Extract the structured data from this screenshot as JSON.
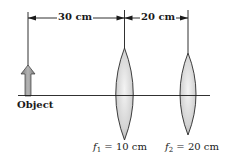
{
  "diagram": {
    "type": "two-lens optical system",
    "dimensions": [
      {
        "label": "30 cm",
        "from": "object",
        "to": "lens-1"
      },
      {
        "label": "20 cm",
        "from": "lens-1",
        "to": "lens-2"
      }
    ],
    "object_label": "Object",
    "lenses": [
      {
        "symbol": "f",
        "subscript": "1",
        "equals": "=",
        "value": "10 cm"
      },
      {
        "symbol": "f",
        "subscript": "2",
        "equals": "=",
        "value": "20 cm"
      }
    ],
    "colors": {
      "line": "#1a1a1a",
      "lens_fill_light": "#f2f2f2",
      "lens_fill_dark": "#b9b9b9",
      "object_arrow": "#9a9a9a"
    }
  }
}
